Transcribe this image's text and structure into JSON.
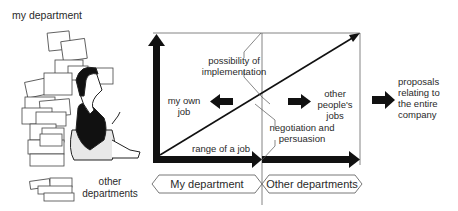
{
  "illustration": {
    "top_label": "my department",
    "bottom_label_line1": "other",
    "bottom_label_line2": "departments"
  },
  "diagram": {
    "label_possibility_1": "possibility of",
    "label_possibility_2": "implementation",
    "label_my_own_1": "my own",
    "label_my_own_2": "job",
    "label_other_people_1": "other",
    "label_other_people_2": "people's",
    "label_other_people_3": "jobs",
    "label_negotiation_1": "negotiation and",
    "label_negotiation_2": "persuasion",
    "label_range": "range of a job",
    "label_proposals_1": "proposals",
    "label_proposals_2": "relating to",
    "label_proposals_3": "the entire",
    "label_proposals_4": "company",
    "tag_my_department": "My department",
    "tag_other_departments": "Other departments"
  },
  "colors": {
    "ink": "#1a1a1a",
    "line": "#555555"
  }
}
